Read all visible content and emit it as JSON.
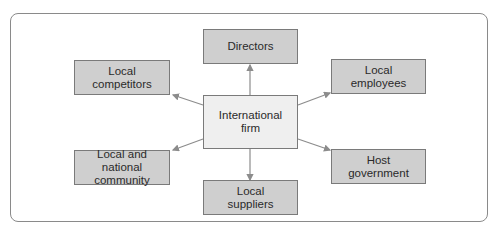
{
  "diagram": {
    "center": {
      "label": "International\nfirm"
    },
    "stakeholders": [
      {
        "id": "directors",
        "label": "Directors"
      },
      {
        "id": "local-competitors",
        "label": "Local\ncompetitors"
      },
      {
        "id": "local-employees",
        "label": "Local\nemployees"
      },
      {
        "id": "local-national-community",
        "label": "Local and\nnational community"
      },
      {
        "id": "host-government",
        "label": "Host\ngovernment"
      },
      {
        "id": "local-suppliers",
        "label": "Local\nsuppliers"
      }
    ],
    "colors": {
      "stakeholder_fill": "#cfcfcf",
      "center_fill": "#efefef",
      "border": "#7a7a7a",
      "arrow": "#8c8c8c"
    }
  }
}
